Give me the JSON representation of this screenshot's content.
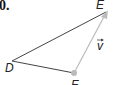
{
  "problem_number": "0.",
  "figure": {
    "type": "triangle-with-vector",
    "points": {
      "D": {
        "label": "D",
        "x": 12,
        "y": 61
      },
      "E": {
        "label": "E",
        "x": 108,
        "y": 11
      },
      "F": {
        "label": "F",
        "x": 74,
        "y": 73
      }
    },
    "vector": {
      "label": "v",
      "from": "F",
      "to": "E"
    },
    "colors": {
      "edge": "#444444",
      "vector": "#bbbbbb",
      "point": "#bbbbbb"
    }
  }
}
